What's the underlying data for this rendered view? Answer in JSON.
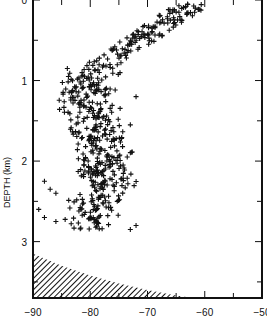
{
  "chart_data": {
    "type": "scatter",
    "title": "",
    "xlabel": "",
    "ylabel": "DEPTH (km)",
    "xlim": [
      -90,
      -50
    ],
    "ylim": [
      3.7,
      0
    ],
    "y_inverted": true,
    "x_ticks": [
      -90,
      -80,
      -70,
      -60,
      -50
    ],
    "x_tick_labels": [
      "−90",
      "−80",
      "−70",
      "−60",
      "−50"
    ],
    "x_minor_tick_step": 5,
    "y_ticks": [
      0,
      1,
      2,
      3
    ],
    "y_tick_labels": [
      "0",
      "1",
      "2",
      "3"
    ],
    "y_minor_tick_step": 0.5,
    "grid": false,
    "legend": null,
    "marker": "+",
    "marker_color": "#111111",
    "series": [
      {
        "name": "events",
        "description": "Dense cluster of '+' markers; shallow branch trends from about (-80, 0.9 km) up to (-62, 0.05 km); deeper body spans roughly -85 to -72 between 0.9 and 2.85 km",
        "clusters": [
          {
            "x_range": [
              -80,
              -62
            ],
            "depth_range": [
              0.05,
              0.9
            ],
            "trend": "diagonal",
            "count": 140
          },
          {
            "x_range": [
              -84,
              -73
            ],
            "depth_range": [
              0.9,
              1.6
            ],
            "count": 150
          },
          {
            "x_range": [
              -85,
              -74
            ],
            "depth_range": [
              1.6,
              2.2
            ],
            "count": 150
          },
          {
            "x_range": [
              -83,
              -72
            ],
            "depth_range": [
              2.2,
              2.85
            ],
            "count": 120
          }
        ],
        "outliers": [
          {
            "x": -63,
            "y": 0.05
          },
          {
            "x": -65,
            "y": 0.15
          },
          {
            "x": -66,
            "y": 0.25
          },
          {
            "x": -71,
            "y": 0.45
          },
          {
            "x": -84,
            "y": 0.85
          },
          {
            "x": -72,
            "y": 1.2
          },
          {
            "x": -73,
            "y": 1.55
          },
          {
            "x": -88,
            "y": 2.25
          },
          {
            "x": -87,
            "y": 2.35
          },
          {
            "x": -86,
            "y": 2.4
          },
          {
            "x": -89,
            "y": 2.6
          },
          {
            "x": -88,
            "y": 2.7
          },
          {
            "x": -86,
            "y": 2.75
          },
          {
            "x": -73,
            "y": 2.85
          },
          {
            "x": -72,
            "y": 2.8
          }
        ]
      }
    ],
    "annotations": [
      {
        "type": "hatched_region",
        "description": "Diagonally hatched area at bottom-left",
        "polygon": [
          [
            -90,
            3.15
          ],
          [
            -85,
            3.3
          ],
          [
            -80,
            3.42
          ],
          [
            -75,
            3.52
          ],
          [
            -70,
            3.6
          ],
          [
            -65,
            3.67
          ],
          [
            -62,
            3.7
          ],
          [
            -90,
            3.7
          ]
        ]
      }
    ]
  }
}
